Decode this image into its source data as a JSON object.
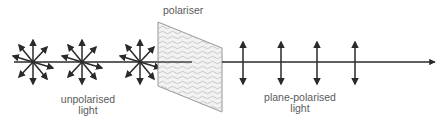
{
  "diagram": {
    "type": "physics-illustration",
    "labels": {
      "polariser": "polariser",
      "unpolarised_line1": "unpolarised",
      "unpolarised_line2": "light",
      "plane_polarised_line1": "plane-polarised",
      "plane_polarised_line2": "light"
    },
    "elements": {
      "unpolarised_wavefronts": 3,
      "plane_polarised_oscillations": 4,
      "propagation_direction": "left-to-right"
    },
    "colors": {
      "line": "#2a2a2a",
      "text": "#5a5a5a",
      "polariser_fill": "#f2f2f2",
      "polariser_edge": "#8a8a8a",
      "polariser_texture": "#bdbdbd"
    }
  }
}
